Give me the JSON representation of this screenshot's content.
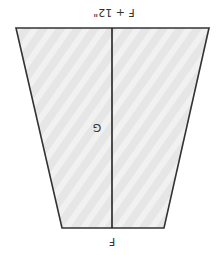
{
  "diagram": {
    "type": "trapezoid-panel-template",
    "orientation": "rotated-180",
    "shape": {
      "top_left": [
        16,
        28
      ],
      "top_right": [
        209,
        28
      ],
      "bottom_right": [
        164,
        228
      ],
      "bottom_left": [
        62,
        228
      ],
      "fill": "#e6e6e6",
      "hatch_color": "#f3f3f3",
      "stroke": "#333333"
    },
    "center_line": {
      "x": 112,
      "y1": 28,
      "y2": 228,
      "color": "#222222"
    },
    "labels": {
      "top_edge": "F + 12\"",
      "bottom_edge": "F",
      "center_mark": "G"
    }
  }
}
